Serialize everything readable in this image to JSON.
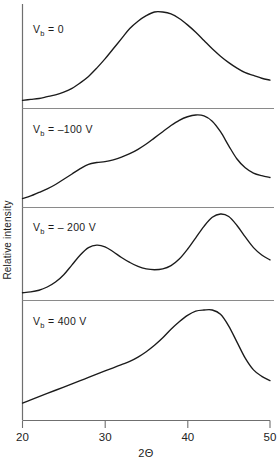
{
  "chart_data": {
    "type": "line",
    "title": "",
    "xlabel": "2Θ",
    "ylabel": "Relative intensity",
    "xlim": [
      20,
      50
    ],
    "xticks": [
      20,
      30,
      40,
      50
    ],
    "xticklabels": [
      "20",
      "30",
      "40",
      "50"
    ],
    "yticks": [],
    "yticklabels": [],
    "grid": false,
    "legend": "none",
    "layout": "4 stacked panels sharing one x-axis, y-axis unlabeled (relative units)",
    "panels": [
      {
        "index": 0,
        "label": "V",
        "label_sub": "b",
        "label_rest": " = 0",
        "label_full": "Vᵦ = 0",
        "annotation": "V_b = 0",
        "peaks": [
          {
            "x": 36.6,
            "relative_height": 1.0,
            "type": "broad main peak"
          }
        ],
        "description": "Single broad amorphous-like hump centred near 2Θ = 36.6",
        "x": [
          20,
          21,
          22,
          23,
          24,
          25,
          26,
          27,
          28,
          29,
          30,
          31,
          32,
          33,
          34,
          35,
          36,
          37,
          38,
          39,
          40,
          41,
          42,
          43,
          44,
          45,
          46,
          47,
          48,
          49,
          50
        ],
        "y": [
          0.04,
          0.05,
          0.06,
          0.08,
          0.1,
          0.13,
          0.17,
          0.23,
          0.3,
          0.39,
          0.49,
          0.6,
          0.71,
          0.82,
          0.9,
          0.96,
          1.0,
          1.0,
          0.98,
          0.93,
          0.86,
          0.78,
          0.69,
          0.6,
          0.52,
          0.45,
          0.39,
          0.34,
          0.31,
          0.28,
          0.26
        ]
      },
      {
        "index": 1,
        "label": "V",
        "label_sub": "b",
        "label_rest": " = –100 V",
        "label_full": "Vᵦ = –100 V",
        "annotation": "V_b = -100 V",
        "peaks": [
          {
            "x": 29.0,
            "relative_height": 0.46,
            "type": "shoulder"
          },
          {
            "x": 41.6,
            "relative_height": 1.0,
            "type": "main peak"
          }
        ],
        "description": "Rising background with a shoulder near 2Θ = 29 and a main peak near 2Θ = 41.6",
        "x": [
          20,
          21,
          22,
          23,
          24,
          25,
          26,
          27,
          28,
          29,
          30,
          31,
          32,
          33,
          34,
          35,
          36,
          37,
          38,
          39,
          40,
          41,
          42,
          43,
          44,
          45,
          46,
          47,
          48,
          49,
          50
        ],
        "y": [
          0.05,
          0.08,
          0.12,
          0.16,
          0.21,
          0.27,
          0.33,
          0.39,
          0.44,
          0.46,
          0.47,
          0.49,
          0.52,
          0.56,
          0.61,
          0.67,
          0.74,
          0.81,
          0.88,
          0.94,
          0.98,
          1.0,
          0.99,
          0.93,
          0.81,
          0.65,
          0.5,
          0.4,
          0.34,
          0.31,
          0.29
        ]
      },
      {
        "index": 2,
        "label": "V",
        "label_sub": "b",
        "label_rest": " = – 200 V",
        "label_full": "Vᵦ = – 200 V",
        "annotation": "V_b = -200 V",
        "peaks": [
          {
            "x": 28.9,
            "relative_height": 0.62,
            "type": "first peak"
          },
          {
            "x": 36.0,
            "relative_height": 0.33,
            "type": "valley"
          },
          {
            "x": 44.0,
            "relative_height": 1.0,
            "type": "second peak"
          }
        ],
        "description": "Two resolved peaks near 2Θ = 29 and 2Θ = 44 with a valley near 2Θ = 36",
        "x": [
          20,
          21,
          22,
          23,
          24,
          25,
          26,
          27,
          28,
          29,
          30,
          31,
          32,
          33,
          34,
          35,
          36,
          37,
          38,
          39,
          40,
          41,
          42,
          43,
          44,
          45,
          46,
          47,
          48,
          49,
          50
        ],
        "y": [
          0.04,
          0.05,
          0.07,
          0.11,
          0.17,
          0.26,
          0.38,
          0.5,
          0.59,
          0.62,
          0.6,
          0.54,
          0.47,
          0.41,
          0.36,
          0.33,
          0.32,
          0.33,
          0.37,
          0.45,
          0.57,
          0.71,
          0.85,
          0.96,
          1.0,
          0.97,
          0.86,
          0.72,
          0.59,
          0.5,
          0.44
        ]
      },
      {
        "index": 3,
        "label": "V",
        "label_sub": "b",
        "label_rest": " =  400 V",
        "label_full": "Vᵦ =  400 V",
        "annotation": "V_b = 400 V",
        "peaks": [
          {
            "x": 43.0,
            "relative_height": 1.0,
            "type": "main peak"
          }
        ],
        "description": "Slowly rising background with a sharp peak near 2Θ = 43",
        "x": [
          20,
          21,
          22,
          23,
          24,
          25,
          26,
          27,
          28,
          29,
          30,
          31,
          32,
          33,
          34,
          35,
          36,
          37,
          38,
          39,
          40,
          41,
          42,
          43,
          44,
          45,
          46,
          47,
          48,
          49,
          50
        ],
        "y": [
          0.13,
          0.16,
          0.19,
          0.22,
          0.25,
          0.28,
          0.31,
          0.34,
          0.37,
          0.4,
          0.43,
          0.46,
          0.49,
          0.52,
          0.56,
          0.61,
          0.67,
          0.74,
          0.82,
          0.89,
          0.95,
          0.99,
          1.0,
          1.0,
          0.96,
          0.85,
          0.7,
          0.55,
          0.44,
          0.38,
          0.34
        ]
      }
    ]
  },
  "colors": {
    "curve": "#1b1b1b",
    "axis": "#6f6f6f",
    "divider": "#8a8a8a",
    "background": "#ffffff",
    "text": "#1b1b1b"
  }
}
